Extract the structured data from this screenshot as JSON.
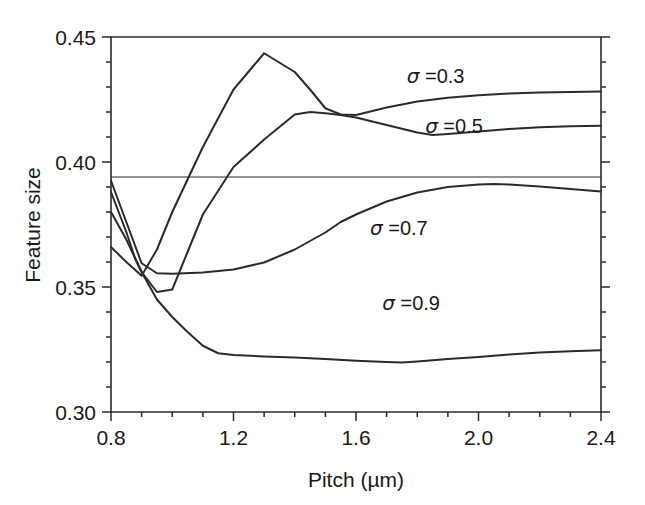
{
  "chart_data": {
    "type": "line",
    "title": "",
    "xlabel": "Pitch (µm)",
    "ylabel": "Feature size",
    "xlim": [
      0.8,
      2.4
    ],
    "ylim": [
      0.3,
      0.45
    ],
    "x_major_ticks": [
      0.8,
      1.2,
      1.6,
      2.0,
      2.4
    ],
    "x_major_ticklabels": [
      "0.8",
      "1.2",
      "1.6",
      "2.0",
      "2.4"
    ],
    "x_minor_tick_step": 0.1,
    "y_major_ticks": [
      0.3,
      0.35,
      0.4,
      0.45
    ],
    "y_major_ticklabels": [
      "0.30",
      "0.35",
      "0.40",
      "0.45"
    ],
    "y_minor_tick_step": 0.01,
    "grid": false,
    "legend_position": "inline-labels",
    "reference_line": {
      "orientation": "horizontal",
      "y": 0.394,
      "label": ""
    },
    "series": [
      {
        "name": "σ = 0.3",
        "label": "σ =0.3",
        "label_at": {
          "x": 1.86,
          "y": 0.4345
        },
        "x": [
          0.8,
          0.85,
          0.9,
          0.95,
          1.0,
          1.05,
          1.1,
          1.2,
          1.3,
          1.4,
          1.45,
          1.5,
          1.55,
          1.6,
          1.7,
          1.8,
          1.9,
          2.0,
          2.1,
          2.2,
          2.3,
          2.4
        ],
        "y": [
          0.366,
          0.36,
          0.3545,
          0.365,
          0.38,
          0.393,
          0.406,
          0.429,
          0.4435,
          0.436,
          0.429,
          0.4215,
          0.419,
          0.4188,
          0.4218,
          0.4242,
          0.4257,
          0.4267,
          0.4274,
          0.4278,
          0.428,
          0.4282
        ]
      },
      {
        "name": "σ = 0.5",
        "label": "σ =0.5",
        "label_at": {
          "x": 1.92,
          "y": 0.4145
        },
        "x": [
          0.8,
          0.85,
          0.88,
          0.9,
          0.95,
          1.0,
          1.05,
          1.1,
          1.2,
          1.3,
          1.4,
          1.45,
          1.5,
          1.55,
          1.6,
          1.7,
          1.8,
          1.85,
          1.9,
          2.0,
          2.1,
          2.2,
          2.3,
          2.4
        ],
        "y": [
          0.388,
          0.372,
          0.361,
          0.356,
          0.348,
          0.349,
          0.364,
          0.379,
          0.398,
          0.409,
          0.419,
          0.42,
          0.4195,
          0.4188,
          0.4178,
          0.4148,
          0.4118,
          0.4108,
          0.4112,
          0.4122,
          0.4132,
          0.4139,
          0.4143,
          0.4145
        ]
      },
      {
        "name": "σ = 0.7",
        "label": "σ =0.7",
        "label_at": {
          "x": 1.74,
          "y": 0.3735
        },
        "x": [
          0.8,
          0.85,
          0.9,
          0.95,
          1.0,
          1.1,
          1.2,
          1.3,
          1.4,
          1.5,
          1.55,
          1.6,
          1.7,
          1.8,
          1.9,
          2.0,
          2.05,
          2.1,
          2.2,
          2.3,
          2.4
        ],
        "y": [
          0.3925,
          0.376,
          0.3595,
          0.3555,
          0.3553,
          0.3558,
          0.357,
          0.3598,
          0.365,
          0.3718,
          0.376,
          0.379,
          0.3842,
          0.3878,
          0.39,
          0.391,
          0.3912,
          0.391,
          0.3902,
          0.3892,
          0.3882
        ]
      },
      {
        "name": "σ = 0.9",
        "label": "σ =0.9",
        "label_at": {
          "x": 1.78,
          "y": 0.3435
        },
        "x": [
          0.8,
          0.85,
          0.9,
          0.95,
          1.0,
          1.05,
          1.1,
          1.15,
          1.2,
          1.3,
          1.4,
          1.5,
          1.6,
          1.7,
          1.75,
          1.8,
          1.9,
          2.0,
          2.1,
          2.2,
          2.3,
          2.4
        ],
        "y": [
          0.38,
          0.369,
          0.356,
          0.345,
          0.338,
          0.332,
          0.3265,
          0.3235,
          0.3228,
          0.3222,
          0.3218,
          0.3212,
          0.3205,
          0.32,
          0.3198,
          0.3202,
          0.3212,
          0.322,
          0.323,
          0.3238,
          0.3243,
          0.3247
        ]
      }
    ]
  }
}
